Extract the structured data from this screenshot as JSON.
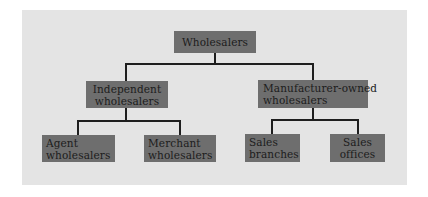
{
  "diagram": {
    "type": "org-chart",
    "root": {
      "label": "Wholesalers",
      "children": [
        {
          "label_lines": [
            "Independent",
            "wholesalers"
          ],
          "children": [
            {
              "label_lines": [
                "Agent",
                "wholesalers"
              ]
            },
            {
              "label_lines": [
                "Merchant",
                "wholesalers"
              ]
            }
          ]
        },
        {
          "label_lines": [
            "Manufacturer-owned",
            "wholesalers"
          ],
          "children": [
            {
              "label_lines": [
                "Sales",
                "branches"
              ]
            },
            {
              "label_lines": [
                "Sales",
                "offices"
              ]
            }
          ]
        }
      ]
    },
    "colors": {
      "background": "#ffffff",
      "panel": "#e4e4e4",
      "box_fill": "#6e6e6e",
      "text": "#1c1c1c",
      "connector": "#1e1e1e"
    }
  }
}
